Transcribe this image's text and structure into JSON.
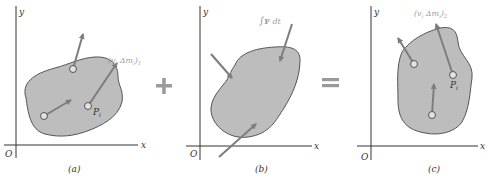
{
  "figure": {
    "panels": [
      {
        "id": "a",
        "caption": "(a)",
        "axis_x": "x",
        "axis_y": "y",
        "origin": "O",
        "momentum_label": "(v",
        "momentum_label_sub_i": "i",
        "momentum_label_mid": " Δm",
        "momentum_label_sub_i2": "i",
        "momentum_label_close": ")",
        "momentum_label_sub": "1",
        "point_label": "P",
        "point_label_sub": "i"
      },
      {
        "id": "b",
        "caption": "(b)",
        "axis_x": "x",
        "axis_y": "y",
        "origin": "O",
        "impulse_label_integral": "∫",
        "impulse_label_F": "F",
        "impulse_label_dt": " dt"
      },
      {
        "id": "c",
        "caption": "(c)",
        "axis_x": "x",
        "axis_y": "y",
        "origin": "O",
        "momentum_label": "(v",
        "momentum_label_sub_i": "i",
        "momentum_label_mid": " Δm",
        "momentum_label_sub_i2": "i",
        "momentum_label_close": ")",
        "momentum_label_sub": "2",
        "point_label": "P",
        "point_label_sub": "i"
      }
    ],
    "operators": {
      "plus": "+",
      "equals": "="
    },
    "colors": {
      "body_fill": "#bdbdbd",
      "body_stroke": "#555555",
      "arrow": "#7d7d7d",
      "axis": "#333333",
      "operator": "#9a9a9a",
      "label_light": "#9c9c9c",
      "text": "#333333"
    }
  }
}
